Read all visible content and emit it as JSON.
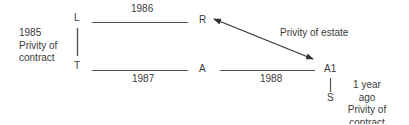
{
  "diagram": {
    "nodes": {
      "L": "L",
      "T": "T",
      "R": "R",
      "A": "A",
      "A1": "A1",
      "S": "S"
    },
    "edges": {
      "L_R": {
        "label": "1986"
      },
      "T_A": {
        "label": "1987"
      },
      "A_A1": {
        "label": "1988"
      },
      "R_A1": {
        "label": "Privity of estate",
        "type": "double-arrow"
      },
      "L_T": {
        "label": ""
      },
      "A1_S": {
        "label": ""
      }
    },
    "notes": {
      "left": {
        "line1": "1985",
        "line2": "Privity of",
        "line3": "contract"
      },
      "right": {
        "line1": "1 year ago",
        "line2": "Privity of",
        "line3": "contract"
      }
    },
    "colors": {
      "line": "#555555",
      "text": "#3a3a3a"
    }
  }
}
